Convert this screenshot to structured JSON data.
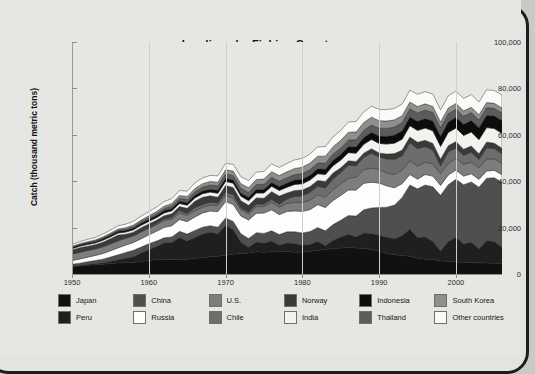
{
  "chart_data": {
    "type": "area",
    "stacked": true,
    "title": "Landings by Fishing Country",
    "source_note": "Source: The Sea Around Us Project (2011), www.seaaroundus.org",
    "xlabel": "",
    "ylabel": "Catch (thousand metric tons)",
    "xlim": [
      1950,
      2006
    ],
    "ylim": [
      0,
      100000
    ],
    "grid": false,
    "legend_position": "bottom",
    "ytick_labels": [
      "0",
      "20,000",
      "40,000",
      "60,000",
      "80,000",
      "100,000"
    ],
    "ytick_values": [
      0,
      20000,
      40000,
      60000,
      80000,
      100000
    ],
    "xtick_labels": [
      "1950",
      "1960",
      "1970",
      "1980",
      "1990",
      "2000"
    ],
    "xtick_values": [
      1950,
      1960,
      1970,
      1980,
      1990,
      2000
    ],
    "x": [
      1950,
      1951,
      1952,
      1953,
      1954,
      1955,
      1956,
      1957,
      1958,
      1959,
      1960,
      1961,
      1962,
      1963,
      1964,
      1965,
      1966,
      1967,
      1968,
      1969,
      1970,
      1971,
      1972,
      1973,
      1974,
      1975,
      1976,
      1977,
      1978,
      1979,
      1980,
      1981,
      1982,
      1983,
      1984,
      1985,
      1986,
      1987,
      1988,
      1989,
      1990,
      1991,
      1992,
      1993,
      1994,
      1995,
      1996,
      1997,
      1998,
      1999,
      2000,
      2001,
      2002,
      2003,
      2004,
      2005,
      2006
    ],
    "colors": {
      "japan": "#111111",
      "peru": "#1f1f1f",
      "china": "#4f4f4f",
      "russia": "#fdfdfb",
      "us": "#7d7d7d",
      "chile": "#6d6d6d",
      "norway": "#3a3a3a",
      "india": "#f2f2ee",
      "indonesia": "#0c0c0c",
      "thailand": "#5c5c5c",
      "south_korea": "#8f8f8f",
      "other": "#fafaf7",
      "background": "#e6e6e3",
      "frame": "#1d1d1d",
      "text": "#111111"
    },
    "series": [
      {
        "name": "Japan",
        "key": "japan",
        "color": "#111111",
        "values": [
          3200,
          3500,
          3800,
          4000,
          4200,
          4500,
          4700,
          4900,
          5000,
          5400,
          5800,
          6200,
          6400,
          6300,
          6200,
          6400,
          6800,
          7000,
          7400,
          7700,
          8100,
          8500,
          8800,
          9100,
          9600,
          9400,
          9600,
          9800,
          9700,
          9400,
          9500,
          9800,
          10200,
          10600,
          11000,
          11200,
          11400,
          11200,
          11000,
          10600,
          9800,
          8900,
          8300,
          8000,
          7600,
          6800,
          6400,
          6200,
          5600,
          5500,
          5200,
          5100,
          4900,
          4800,
          4700,
          4600,
          4500
        ]
      },
      {
        "name": "Peru",
        "key": "peru",
        "color": "#1f1f1f",
        "values": [
          120,
          180,
          260,
          400,
          600,
          900,
          1400,
          1900,
          2400,
          3600,
          4700,
          5700,
          7000,
          7300,
          9500,
          7800,
          8900,
          10200,
          10600,
          9600,
          12800,
          10700,
          4900,
          2400,
          4200,
          3900,
          4600,
          2600,
          3700,
          3800,
          2900,
          2900,
          3800,
          1600,
          3500,
          4700,
          5700,
          4800,
          6700,
          6900,
          6900,
          6900,
          6900,
          8500,
          11800,
          8900,
          9500,
          7900,
          4300,
          8500,
          10600,
          7900,
          8800,
          6100,
          9600,
          9400,
          7000
        ]
      },
      {
        "name": "China",
        "key": "china",
        "color": "#4f4f4f",
        "values": [
          900,
          1000,
          1200,
          1400,
          1600,
          1900,
          2200,
          2500,
          2800,
          2600,
          2500,
          2300,
          2200,
          2400,
          2700,
          3000,
          3100,
          3000,
          2800,
          2900,
          3200,
          3400,
          3600,
          3800,
          4000,
          4200,
          4400,
          4600,
          4800,
          5000,
          5300,
          5600,
          6000,
          6400,
          6800,
          7300,
          8100,
          9000,
          10000,
          11000,
          12000,
          13000,
          14500,
          16500,
          19000,
          21000,
          22500,
          23500,
          24000,
          24500,
          25000,
          25500,
          26000,
          26500,
          27000,
          27500,
          28000
        ]
      },
      {
        "name": "Russia",
        "key": "russia",
        "color": "#fdfdfb",
        "values": [
          1600,
          1800,
          2000,
          2200,
          2400,
          2700,
          3000,
          3200,
          3400,
          3600,
          3900,
          4200,
          4500,
          4800,
          5100,
          5400,
          5800,
          6100,
          6400,
          6700,
          7100,
          7400,
          7700,
          8000,
          8400,
          8800,
          9100,
          8600,
          8800,
          9000,
          9300,
          9500,
          9900,
          10100,
          10400,
          10700,
          11000,
          11200,
          11400,
          11100,
          10500,
          9200,
          7500,
          6000,
          4500,
          4200,
          4500,
          4600,
          4300,
          4200,
          4000,
          3700,
          3500,
          3400,
          3100,
          3200,
          3300
        ]
      },
      {
        "name": "U.S.",
        "key": "us",
        "color": "#7d7d7d",
        "values": [
          2800,
          2900,
          2900,
          2800,
          2900,
          2900,
          3000,
          2900,
          2800,
          2900,
          2800,
          2900,
          3000,
          2900,
          2800,
          2800,
          2600,
          2500,
          2600,
          2600,
          2800,
          2800,
          2700,
          2700,
          2800,
          2900,
          3100,
          3200,
          3500,
          3700,
          3900,
          4000,
          4200,
          4400,
          4800,
          5000,
          5100,
          5600,
          5900,
          6000,
          6000,
          5600,
          5700,
          5900,
          5900,
          5700,
          5300,
          5300,
          5100,
          5000,
          5100,
          5100,
          5000,
          4900,
          5100,
          5000,
          4900
        ]
      },
      {
        "name": "Chile",
        "key": "chile",
        "color": "#6d6d6d",
        "values": [
          90,
          100,
          130,
          180,
          220,
          250,
          260,
          230,
          240,
          270,
          340,
          430,
          640,
          780,
          1160,
          700,
          1390,
          1100,
          1100,
          1100,
          1200,
          1400,
          800,
          700,
          1100,
          1000,
          1300,
          1300,
          1800,
          2500,
          2800,
          3400,
          3700,
          4000,
          4500,
          4800,
          5600,
          4800,
          5300,
          6500,
          5200,
          6000,
          6500,
          6000,
          7800,
          7400,
          6700,
          5900,
          3300,
          5000,
          4300,
          3800,
          4300,
          3600,
          4900,
          4300,
          4200
        ]
      },
      {
        "name": "Norway",
        "key": "norway",
        "color": "#3a3a3a",
        "values": [
          1600,
          1800,
          1700,
          1600,
          1800,
          2000,
          2200,
          1500,
          1400,
          1600,
          1500,
          1400,
          1400,
          1500,
          1600,
          2200,
          2800,
          3200,
          2800,
          2500,
          2900,
          3100,
          3100,
          2900,
          2700,
          2500,
          3400,
          3500,
          2600,
          2600,
          2500,
          2500,
          2500,
          2800,
          2500,
          2100,
          1900,
          1900,
          1800,
          1900,
          1800,
          2100,
          2500,
          2500,
          2400,
          2800,
          2700,
          2900,
          2900,
          2600,
          2900,
          2700,
          2700,
          2500,
          2500,
          2400,
          2300
        ]
      },
      {
        "name": "India",
        "key": "india",
        "color": "#f2f2ee",
        "values": [
          600,
          650,
          700,
          750,
          800,
          850,
          900,
          950,
          1000,
          1050,
          1100,
          1150,
          1200,
          1250,
          1300,
          1350,
          1400,
          1500,
          1600,
          1700,
          1800,
          1850,
          1900,
          2000,
          2100,
          2200,
          2300,
          2400,
          2500,
          2600,
          2700,
          2800,
          2900,
          3000,
          3200,
          3300,
          3500,
          3600,
          3800,
          4000,
          4100,
          4300,
          4500,
          4700,
          4900,
          5100,
          5300,
          5400,
          5500,
          5700,
          5800,
          5900,
          6000,
          6100,
          6200,
          6300,
          6400
        ]
      },
      {
        "name": "Indonesia",
        "key": "indonesia",
        "color": "#0c0c0c",
        "values": [
          500,
          540,
          580,
          620,
          660,
          700,
          740,
          780,
          820,
          860,
          900,
          940,
          980,
          1020,
          1060,
          1100,
          1150,
          1200,
          1250,
          1300,
          1350,
          1400,
          1450,
          1500,
          1560,
          1620,
          1680,
          1750,
          1820,
          1900,
          1980,
          2050,
          2150,
          2250,
          2350,
          2450,
          2600,
          2750,
          2900,
          3050,
          3200,
          3350,
          3500,
          3650,
          3800,
          3950,
          4100,
          4250,
          4400,
          4550,
          4700,
          4850,
          5000,
          5150,
          5300,
          5450,
          5600
        ]
      },
      {
        "name": "Thailand",
        "key": "thailand",
        "color": "#5c5c5c",
        "values": [
          200,
          230,
          260,
          300,
          340,
          380,
          430,
          480,
          540,
          600,
          700,
          800,
          950,
          1100,
          1250,
          1400,
          1550,
          1700,
          1800,
          1850,
          1900,
          1950,
          2000,
          2050,
          2100,
          2150,
          2200,
          2250,
          2300,
          2350,
          2400,
          2450,
          2500,
          2600,
          2700,
          2800,
          2900,
          3000,
          3100,
          3200,
          3300,
          3400,
          3450,
          3500,
          3550,
          3600,
          3650,
          3700,
          3600,
          3550,
          3500,
          3450,
          3400,
          3350,
          3300,
          3250,
          3200
        ]
      },
      {
        "name": "South Korea",
        "key": "south_korea",
        "color": "#8f8f8f",
        "values": [
          300,
          340,
          380,
          420,
          470,
          520,
          580,
          640,
          700,
          760,
          830,
          900,
          980,
          1060,
          1150,
          1250,
          1350,
          1450,
          1550,
          1650,
          1750,
          1850,
          1950,
          2050,
          2150,
          2250,
          2350,
          2450,
          2550,
          2650,
          2750,
          2850,
          2950,
          3050,
          3150,
          3250,
          3300,
          3350,
          3400,
          3350,
          3300,
          3200,
          3100,
          3000,
          2900,
          2800,
          2700,
          2600,
          2500,
          2450,
          2400,
          2350,
          2300,
          2250,
          2200,
          2150,
          2100
        ]
      },
      {
        "name": "Other countries",
        "key": "other",
        "color": "#fafaf7",
        "values": [
          800,
          900,
          1000,
          1100,
          1200,
          1300,
          1400,
          1500,
          1600,
          1700,
          1800,
          1900,
          2000,
          2100,
          2200,
          2300,
          2400,
          2500,
          2600,
          2700,
          2800,
          2900,
          3000,
          3100,
          3200,
          3300,
          3400,
          3500,
          3600,
          3700,
          3800,
          3900,
          4000,
          4100,
          4200,
          4300,
          4400,
          4500,
          4600,
          4700,
          4800,
          4900,
          4950,
          5000,
          5100,
          5200,
          5250,
          5300,
          5200,
          5250,
          5300,
          5350,
          5400,
          5450,
          5500,
          5550,
          5600
        ]
      }
    ]
  },
  "legend": {
    "rows": [
      [
        {
          "label": "Japan",
          "key": "japan"
        },
        {
          "label": "China",
          "key": "china"
        },
        {
          "label": "U.S.",
          "key": "us"
        },
        {
          "label": "Norway",
          "key": "norway"
        },
        {
          "label": "Indonesia",
          "key": "indonesia"
        },
        {
          "label": "South Korea",
          "key": "south_korea"
        }
      ],
      [
        {
          "label": "Peru",
          "key": "peru"
        },
        {
          "label": "Russia",
          "key": "russia"
        },
        {
          "label": "Chile",
          "key": "chile"
        },
        {
          "label": "India",
          "key": "india"
        },
        {
          "label": "Thailand",
          "key": "thailand"
        },
        {
          "label": "Other countries",
          "key": "other"
        }
      ]
    ]
  }
}
